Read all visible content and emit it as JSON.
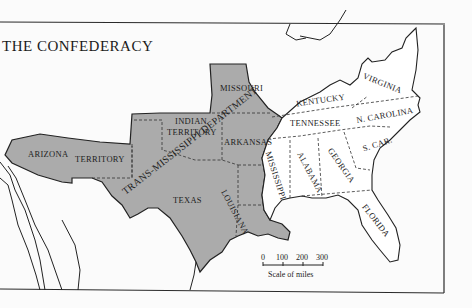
{
  "title": "THE CONFEDERACY",
  "colors": {
    "confederate_trans_mississippi": "#ababab",
    "land": "#ffffff",
    "background": "#fbfbfb",
    "border": "#222222"
  },
  "regions": {
    "trans_mississippi_department": "TRANS-MISSISSIPPI DEPARTMENT",
    "states_west": [
      "MISSOURI",
      "INDIAN",
      "TERRITORY",
      "ARKANSAS",
      "TEXAS",
      "LOUISIANA"
    ],
    "arizona": "ARIZONA",
    "arizona_territory": "TERRITORY",
    "states_east": [
      "KENTUCKY",
      "VIRGINIA",
      "TENNESSEE",
      "N. CAROLINA",
      "MISSISSIPPI",
      "ALABAMA",
      "GEORGIA",
      "S. CAR.",
      "FLORIDA"
    ]
  },
  "labels": {
    "missouri": "MISSOURI",
    "indian_1": "INDIAN",
    "indian_2": "TERRITORY",
    "arkansas": "ARKANSAS",
    "texas": "TEXAS",
    "louisiana": "LOUISIANA",
    "arizona_1": "ARIZONA",
    "arizona_2": "TERRITORY",
    "trans_miss": "TRANS-MISSISSIPPI DEPARTMENT",
    "kentucky": "KENTUCKY",
    "virginia": "VIRGINIA",
    "tennessee": "TENNESSEE",
    "n_carolina": "N. CAROLINA",
    "mississippi": "MISSISSIPPI",
    "alabama": "ALABAMA",
    "georgia": "GEORGIA",
    "s_car": "S. CAR.",
    "florida": "FLORIDA"
  },
  "scale": {
    "ticks": [
      "0",
      "100",
      "200",
      "300"
    ],
    "caption": "Scale of miles"
  }
}
